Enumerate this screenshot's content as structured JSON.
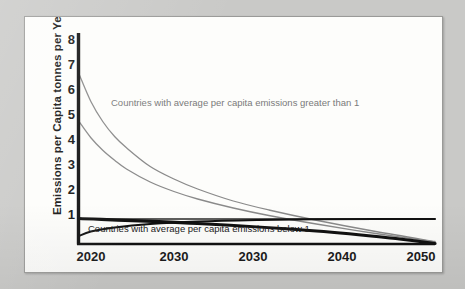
{
  "chart_data": {
    "type": "line",
    "title": "",
    "xlabel": "",
    "ylabel": "Emissions per Capita tonnes per Year",
    "xlim": [
      2020,
      2050
    ],
    "ylim": [
      0,
      8.6
    ],
    "grid": false,
    "legend": "none",
    "x_tick_labels": [
      "2020",
      "2030",
      "2030",
      "2040",
      "2050"
    ],
    "x_tick_values": [
      2020,
      2027.5,
      2035,
      2043,
      2050
    ],
    "y_tick_labels": [
      "8",
      "7",
      "6",
      "5",
      "4",
      "3",
      "2",
      "1"
    ],
    "y_tick_values": [
      8,
      7,
      6,
      5,
      4,
      3,
      2,
      1
    ],
    "annotations": [
      {
        "name": "upper-annotation",
        "text": "Countries with average per capita emissions greater than 1"
      },
      {
        "name": "lower-annotation",
        "text": "Countries with average per capita emissions below 1"
      }
    ],
    "series": [
      {
        "name": "high-emitter-curve-1",
        "color": "#8a8a8a",
        "width": 1.3,
        "x": [
          2020,
          2021,
          2022,
          2023,
          2024,
          2026,
          2028,
          2030,
          2033,
          2036,
          2040,
          2045,
          2050
        ],
        "values": [
          6.8,
          5.7,
          4.9,
          4.3,
          3.85,
          3.1,
          2.6,
          2.2,
          1.72,
          1.36,
          0.95,
          0.5,
          0.1
        ]
      },
      {
        "name": "high-emitter-curve-2",
        "color": "#8a8a8a",
        "width": 1.3,
        "x": [
          2020,
          2021,
          2022,
          2023,
          2024,
          2026,
          2028,
          2030,
          2033,
          2036,
          2040,
          2045,
          2050
        ],
        "values": [
          4.9,
          4.25,
          3.75,
          3.35,
          3.0,
          2.48,
          2.1,
          1.8,
          1.44,
          1.14,
          0.8,
          0.42,
          0.08
        ]
      },
      {
        "name": "threshold-line-at-one",
        "color": "#2a2a2a",
        "width": 1.6,
        "x": [
          2020,
          2050
        ],
        "values": [
          1,
          1
        ]
      },
      {
        "name": "declining-black-line",
        "color": "#111111",
        "width": 3.2,
        "x": [
          2020,
          2030,
          2040,
          2047,
          2050
        ],
        "values": [
          1.02,
          0.82,
          0.52,
          0.2,
          0.02
        ]
      },
      {
        "name": "low-emitter-rising-curve",
        "color": "#111111",
        "width": 1.8,
        "x": [
          2020,
          2021,
          2023,
          2026,
          2030,
          2035,
          2040,
          2045,
          2050
        ],
        "values": [
          0.32,
          0.5,
          0.66,
          0.8,
          0.9,
          0.96,
          0.99,
          1.0,
          1.0
        ]
      }
    ]
  },
  "colors": {
    "background": "#c9c9c7",
    "panel": "#fdfdfb",
    "axis": "#111111",
    "curve_gray": "#8a8a8a",
    "text": "#151515",
    "annotation_gray": "#7a7a7a"
  }
}
